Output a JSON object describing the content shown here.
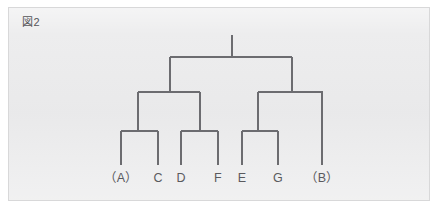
{
  "figure": {
    "label": "図2",
    "panel_bg": "#ececed",
    "panel_border": "#d8d8d9",
    "line_color": "#6c6c70",
    "text_color": "#5a5a5e"
  },
  "chart_data": {
    "type": "diagram",
    "diagram_kind": "dendrogram",
    "title": "図2",
    "orientation": "top-down",
    "leaves": [
      {
        "id": "A",
        "label": "（A）",
        "x": 121
      },
      {
        "id": "C",
        "label": "C",
        "x": 158
      },
      {
        "id": "D",
        "label": "D",
        "x": 181
      },
      {
        "id": "F",
        "label": "F",
        "x": 218
      },
      {
        "id": "E",
        "label": "E",
        "x": 242
      },
      {
        "id": "G",
        "label": "G",
        "x": 278
      },
      {
        "id": "B",
        "label": "（B）",
        "x": 322
      }
    ],
    "levels": {
      "root_top_y": 35,
      "root_bar_y": 57,
      "mid_bar_y": 92,
      "low_bar_y": 131,
      "leaf_bottom_y": 165,
      "label_y": 182
    },
    "nodes": [
      {
        "name": "root",
        "x": 232,
        "y": 57,
        "children": [
          "n_left",
          "n_right"
        ]
      },
      {
        "name": "n_left",
        "x": 170,
        "y": 92,
        "children": [
          "n_AC",
          "n_DF"
        ]
      },
      {
        "name": "n_right",
        "x": 292,
        "y": 92,
        "children": [
          "n_EG",
          "B"
        ]
      },
      {
        "name": "n_AC",
        "x": 138,
        "y": 131,
        "children": [
          "A",
          "C"
        ]
      },
      {
        "name": "n_DF",
        "x": 200,
        "y": 131,
        "children": [
          "D",
          "F"
        ]
      },
      {
        "name": "n_EG",
        "x": 258,
        "y": 131,
        "children": [
          "E",
          "G"
        ]
      }
    ],
    "segments": [
      {
        "name": "root-stem",
        "x1": 232,
        "y1": 35,
        "x2": 232,
        "y2": 57
      },
      {
        "name": "root-bar",
        "x1": 170,
        "y1": 57,
        "x2": 292,
        "y2": 57
      },
      {
        "name": "left-stem",
        "x1": 170,
        "y1": 57,
        "x2": 170,
        "y2": 92
      },
      {
        "name": "right-stem",
        "x1": 292,
        "y1": 57,
        "x2": 292,
        "y2": 92
      },
      {
        "name": "left-mid-bar",
        "x1": 138,
        "y1": 92,
        "x2": 200,
        "y2": 92
      },
      {
        "name": "right-mid-bar",
        "x1": 258,
        "y1": 92,
        "x2": 323,
        "y2": 92
      },
      {
        "name": "ac-stem",
        "x1": 138,
        "y1": 92,
        "x2": 138,
        "y2": 131
      },
      {
        "name": "df-stem",
        "x1": 200,
        "y1": 92,
        "x2": 200,
        "y2": 131
      },
      {
        "name": "eg-stem",
        "x1": 258,
        "y1": 92,
        "x2": 258,
        "y2": 131
      },
      {
        "name": "b-stem",
        "x1": 322,
        "y1": 92,
        "x2": 322,
        "y2": 165
      },
      {
        "name": "ac-bar",
        "x1": 121,
        "y1": 131,
        "x2": 158,
        "y2": 131
      },
      {
        "name": "df-bar",
        "x1": 181,
        "y1": 131,
        "x2": 218,
        "y2": 131
      },
      {
        "name": "eg-bar",
        "x1": 242,
        "y1": 131,
        "x2": 278,
        "y2": 131
      },
      {
        "name": "a-leaf",
        "x1": 121,
        "y1": 131,
        "x2": 121,
        "y2": 165
      },
      {
        "name": "c-leaf",
        "x1": 158,
        "y1": 131,
        "x2": 158,
        "y2": 165
      },
      {
        "name": "d-leaf",
        "x1": 181,
        "y1": 131,
        "x2": 181,
        "y2": 165
      },
      {
        "name": "f-leaf",
        "x1": 218,
        "y1": 131,
        "x2": 218,
        "y2": 165
      },
      {
        "name": "e-leaf",
        "x1": 242,
        "y1": 131,
        "x2": 242,
        "y2": 165
      },
      {
        "name": "g-leaf",
        "x1": 278,
        "y1": 131,
        "x2": 278,
        "y2": 165
      }
    ]
  }
}
